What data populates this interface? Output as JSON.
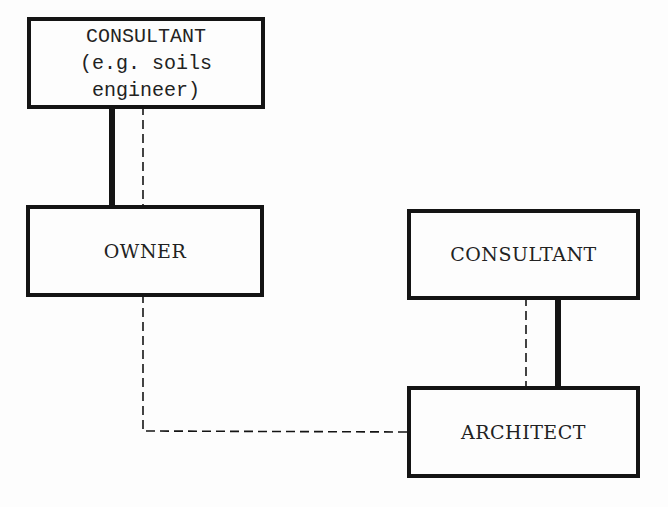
{
  "diagram": {
    "type": "organizational-relationship",
    "nodes": [
      {
        "id": "consultant-soils",
        "label": "CONSULTANT\n(e.g. soils\nengineer)"
      },
      {
        "id": "owner",
        "label": "OWNER"
      },
      {
        "id": "consultant",
        "label": "CONSULTANT"
      },
      {
        "id": "architect",
        "label": "ARCHITECT"
      }
    ],
    "edges": [
      {
        "from": "consultant-soils",
        "to": "owner",
        "style": "solid-heavy"
      },
      {
        "from": "consultant-soils",
        "to": "owner",
        "style": "dashed"
      },
      {
        "from": "consultant",
        "to": "architect",
        "style": "dashed"
      },
      {
        "from": "consultant",
        "to": "architect",
        "style": "solid-heavy"
      },
      {
        "from": "owner",
        "to": "architect",
        "style": "dashed"
      }
    ],
    "colors": {
      "line": "#141414",
      "background": "#fdfdfd"
    }
  }
}
